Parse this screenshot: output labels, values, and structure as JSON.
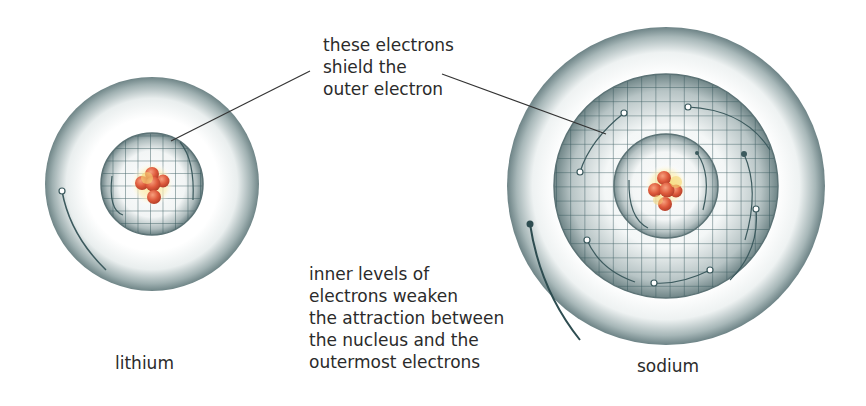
{
  "labels": {
    "shield_callout": "these electrons\nshield the\nouter electron",
    "weaken_note": "inner levels of\nelectrons weaken\nthe attraction between\nthe nucleus and the\noutermost electrons",
    "lithium": "lithium",
    "sodium": "sodium"
  },
  "atoms": [
    {
      "name": "lithium",
      "shells": 2
    },
    {
      "name": "sodium",
      "shells": 3
    }
  ],
  "colors": {
    "shell_outer": "#5f7b7e",
    "shell_light": "#ffffff",
    "grid": "#2e5156",
    "nucleus": "#d9533a",
    "nucleus_glow": "#f7e07a"
  }
}
